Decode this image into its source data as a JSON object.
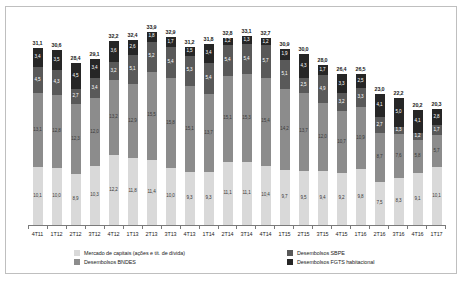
{
  "chart_data": {
    "type": "bar",
    "stacked": true,
    "title": "",
    "xlabel": "",
    "ylabel": "",
    "grid": false,
    "legend_position": "bottom",
    "ylim": [
      0,
      34
    ],
    "categories": [
      "4T11",
      "1T12",
      "2T12",
      "3T12",
      "4T12",
      "1T13",
      "2T13",
      "3T13",
      "4T13",
      "1T14",
      "2T14",
      "3T14",
      "4T14",
      "1T15",
      "2T15",
      "3T15",
      "4T15",
      "1T16",
      "2T16",
      "3T16",
      "4T16",
      "1T17"
    ],
    "totals": [
      "31,1",
      "30,6",
      "28,4",
      "29,1",
      "32,2",
      "32,4",
      "33,9",
      "32,9",
      "31,2",
      "31,8",
      "32,8",
      "33,1",
      "32,7",
      "30,9",
      "30,0",
      "28,0",
      "26,4",
      "26,5",
      "23,0",
      "22,2",
      "20,2",
      "20,3"
    ],
    "series": [
      {
        "name": "Desembolsos FGTS habitacional",
        "color": "#d9d9d9",
        "values": [
          "10,1",
          "10,0",
          "8,9",
          "10,3",
          "12,2",
          "11,8",
          "11,4",
          "10,0",
          "9,3",
          "9,3",
          "11,1",
          "11,1",
          "10,4",
          "9,7",
          "9,5",
          "9,4",
          "9,2",
          "9,8",
          "7,5",
          "8,3",
          "9,1",
          "10,1"
        ]
      },
      {
        "name": "Desembolsos SBPE",
        "color": "#8c8c8c",
        "values": [
          "13,1",
          "12,8",
          "12,3",
          "12,0",
          "13,2",
          "12,9",
          "15,5",
          "15,8",
          "15,1",
          "13,7",
          "15,1",
          "15,3",
          "15,4",
          "14,2",
          "13,7",
          "12,0",
          "10,7",
          "10,9",
          "8,7",
          "7,6",
          "5,8",
          "5,7"
        ]
      },
      {
        "name": "Desembolsos BNDES",
        "color": "#595959",
        "values": [
          "4,5",
          "4,3",
          "2,7",
          "3,4",
          "3,2",
          "5,1",
          "5,2",
          "5,4",
          "5,3",
          "5,4",
          "5,4",
          "5,4",
          "5,7",
          "5,1",
          "2,5",
          "4,9",
          "3,2",
          "3,3",
          "2,7",
          "1,3",
          "1,2",
          "1,7"
        ]
      },
      {
        "name": "Mercado de capitais (ações e tít. de dívida)",
        "color": "#262626",
        "values": [
          "3,4",
          "3,5",
          "4,5",
          "3,4",
          "3,6",
          "2,6",
          "1,8",
          "1,7",
          "1,5",
          "3,4",
          "1,2",
          "1,3",
          "1,2",
          "1,9",
          "4,3",
          "1,7",
          "3,3",
          "2,5",
          "4,1",
          "5,0",
          "4,1",
          "2,8"
        ]
      }
    ],
    "legend": [
      {
        "label": "Mercado de capitais (ações e tít. de dívida)",
        "color": "#d9d9d9"
      },
      {
        "label": "Desembolsos BNDES",
        "color": "#8c8c8c"
      },
      {
        "label": "Desembolsos SBPE",
        "color": "#595959"
      },
      {
        "label": "Desembolsos FGTS habitacional",
        "color": "#262626"
      }
    ]
  }
}
